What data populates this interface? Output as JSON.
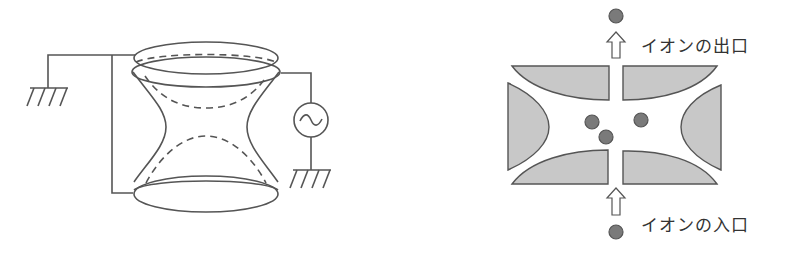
{
  "left_figure": {
    "name": "quadrupole-ion-trap-3d",
    "components": [
      "top-endcap-electrode",
      "ring-electrode",
      "bottom-endcap-electrode",
      "ac-voltage-source",
      "ground-left",
      "ground-right"
    ],
    "ac_source_symbol": "~"
  },
  "right_figure": {
    "name": "ion-trap-cross-section",
    "labels": {
      "exit": "イオンの出口",
      "entrance": "イオンの入口"
    },
    "ion_count_inside": 3
  },
  "colors": {
    "line": "#555555",
    "electrode_fill": "#c8c8c8",
    "ion_fill": "#7a7a7a",
    "ion_stroke": "#555555",
    "text": "#333333"
  }
}
